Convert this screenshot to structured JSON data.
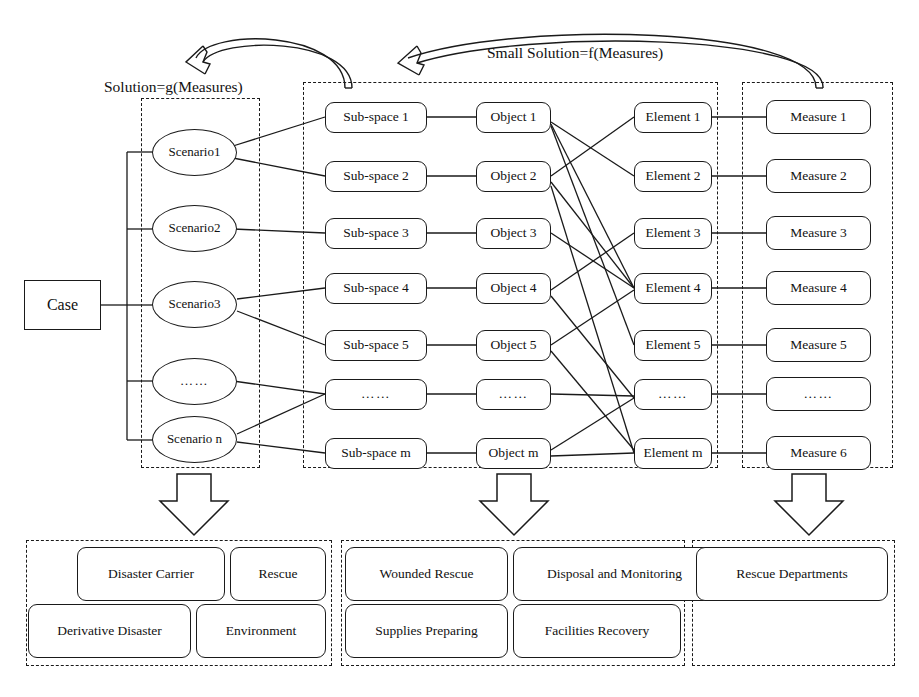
{
  "diagram": {
    "captions": {
      "left_arrow_label": "Solution=g(Measures)",
      "right_arrow_label": "Small Solution=f(Measures)"
    },
    "root": {
      "label": "Case"
    },
    "columns": {
      "scenario": {
        "name": "Scenario",
        "items": [
          {
            "label": "Scenario1"
          },
          {
            "label": "Scenario2"
          },
          {
            "label": "Scenario3"
          },
          {
            "label": "……"
          },
          {
            "label": "Scenario n"
          }
        ]
      },
      "subspace": {
        "name": "Sub-space",
        "items": [
          {
            "label": "Sub-space 1"
          },
          {
            "label": "Sub-space 2"
          },
          {
            "label": "Sub-space 3"
          },
          {
            "label": "Sub-space 4"
          },
          {
            "label": "Sub-space 5"
          },
          {
            "label": "……"
          },
          {
            "label": "Sub-space m"
          }
        ]
      },
      "object": {
        "name": "Object",
        "items": [
          {
            "label": "Object 1"
          },
          {
            "label": "Object 2"
          },
          {
            "label": "Object 3"
          },
          {
            "label": "Object 4"
          },
          {
            "label": "Object 5"
          },
          {
            "label": "……"
          },
          {
            "label": "Object m"
          }
        ]
      },
      "element": {
        "name": "Element",
        "items": [
          {
            "label": "Element 1"
          },
          {
            "label": "Element 2"
          },
          {
            "label": "Element 3"
          },
          {
            "label": "Element 4"
          },
          {
            "label": "Element 5"
          },
          {
            "label": "……"
          },
          {
            "label": "Element m"
          }
        ]
      },
      "measure": {
        "name": "Measure",
        "items": [
          {
            "label": "Measure 1"
          },
          {
            "label": "Measure 2"
          },
          {
            "label": "Measure 3"
          },
          {
            "label": "Measure 4"
          },
          {
            "label": "Measure 5"
          },
          {
            "label": "……"
          },
          {
            "label": "Measure 6"
          }
        ]
      }
    },
    "bottom_groups": [
      {
        "name": "scenario-outcomes",
        "items": [
          {
            "label": "Disaster Carrier"
          },
          {
            "label": "Rescue"
          },
          {
            "label": "Derivative Disaster"
          },
          {
            "label": "Environment"
          }
        ]
      },
      {
        "name": "object-outcomes",
        "items": [
          {
            "label": "Wounded Rescue"
          },
          {
            "label": "Disposal and Monitoring"
          },
          {
            "label": "Supplies Preparing"
          },
          {
            "label": "Facilities Recovery"
          }
        ]
      },
      {
        "name": "measure-outcomes",
        "items": [
          {
            "label": "Rescue Departments"
          }
        ]
      }
    ],
    "colors": {
      "stroke": "#1a1a1a",
      "background": "#ffffff"
    }
  }
}
